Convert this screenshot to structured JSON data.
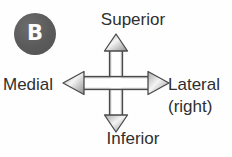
{
  "figure": {
    "panel_label": "B",
    "background_color": "#fefefe",
    "badge_color": "#5d5d5d",
    "badge_text_color": "#fdfdfd",
    "label_color": "#2f2f2f",
    "arrow_stroke_color": "#4a4a4a",
    "arrow_fill_color": "#ffffff"
  },
  "diagram_data": {
    "type": "anatomical-direction-cross",
    "center": {
      "x": 116,
      "y": 84
    },
    "axes": [
      {
        "direction": "up",
        "label": "Superior",
        "sublabel": ""
      },
      {
        "direction": "down",
        "label": "Inferior",
        "sublabel": ""
      },
      {
        "direction": "left",
        "label": "Medial",
        "sublabel": ""
      },
      {
        "direction": "right",
        "label": "Lateral",
        "sublabel": "(right)"
      }
    ]
  },
  "labels": {
    "superior": "Superior",
    "inferior": "Inferior",
    "medial": "Medial",
    "lateral": "Lateral",
    "lateral_sub": "(right)"
  },
  "icons": {
    "cross_arrow": "four-way-arrow-icon"
  }
}
